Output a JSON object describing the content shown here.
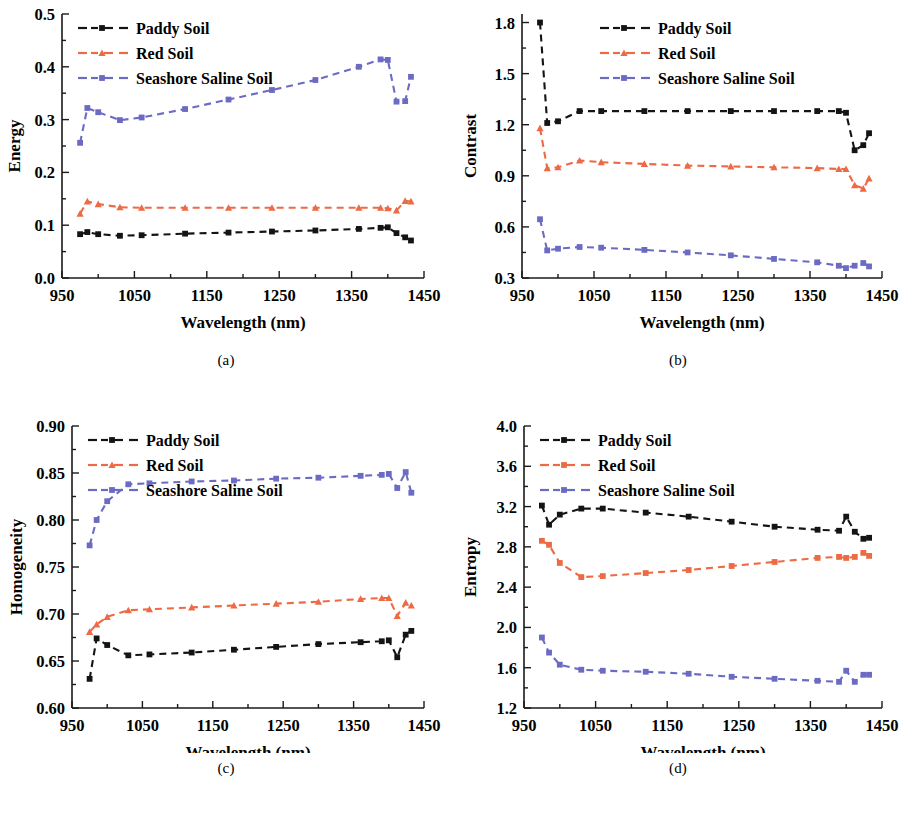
{
  "figure": {
    "panels": [
      {
        "id": "a",
        "caption": "(a)"
      },
      {
        "id": "b",
        "caption": "(b)"
      },
      {
        "id": "c",
        "caption": "(c)"
      },
      {
        "id": "d",
        "caption": "(d)"
      }
    ]
  },
  "legend": {
    "entries": [
      {
        "label": "Paddy Soil",
        "color": "#141414",
        "marker": "square"
      },
      {
        "label": "Red Soil",
        "color": "#ED6A45",
        "marker": "triangle"
      },
      {
        "label": "Seashore Saline Soil",
        "color": "#6B6BC4",
        "marker": "square"
      }
    ]
  },
  "chart_data": [
    {
      "type": "line",
      "panel": "a",
      "title": "",
      "xlabel": "Wavelength (nm)",
      "ylabel": "Energy",
      "xlim": [
        950,
        1450
      ],
      "ylim": [
        0.0,
        0.5
      ],
      "xticks": [
        950,
        1050,
        1150,
        1250,
        1350,
        1450
      ],
      "xticklabels": [
        "950",
        "1050",
        "1150",
        "1250",
        "1350",
        "1450"
      ],
      "yticks": [
        0.0,
        0.1,
        0.2,
        0.3,
        0.4,
        0.5
      ],
      "yticklabels": [
        "0.0",
        "0.1",
        "0.2",
        "0.3",
        "0.4",
        "0.5"
      ],
      "grid": false,
      "legend_position": "top-left",
      "x": [
        975,
        985,
        1000,
        1030,
        1060,
        1120,
        1180,
        1240,
        1300,
        1360,
        1390,
        1400,
        1412,
        1424,
        1432
      ],
      "series": [
        {
          "name": "Paddy Soil",
          "color": "#141414",
          "marker": "square",
          "values": [
            0.083,
            0.087,
            0.083,
            0.08,
            0.081,
            0.084,
            0.086,
            0.088,
            0.09,
            0.093,
            0.095,
            0.096,
            0.085,
            0.077,
            0.071
          ]
        },
        {
          "name": "Red Soil",
          "color": "#ED6A45",
          "marker": "triangle",
          "values": [
            0.122,
            0.145,
            0.14,
            0.134,
            0.133,
            0.133,
            0.133,
            0.133,
            0.133,
            0.133,
            0.133,
            0.132,
            0.128,
            0.146,
            0.145
          ]
        },
        {
          "name": "Seashore Saline Soil",
          "color": "#6B6BC4",
          "marker": "square",
          "values": [
            0.256,
            0.322,
            0.314,
            0.299,
            0.304,
            0.32,
            0.338,
            0.356,
            0.375,
            0.4,
            0.414,
            0.413,
            0.334,
            0.335,
            0.381
          ]
        }
      ]
    },
    {
      "type": "line",
      "panel": "b",
      "title": "",
      "xlabel": "Wavelength (nm)",
      "ylabel": "Contrast",
      "xlim": [
        950,
        1450
      ],
      "ylim": [
        0.3,
        1.85
      ],
      "xticks": [
        950,
        1050,
        1150,
        1250,
        1350,
        1450
      ],
      "xticklabels": [
        "950",
        "1050",
        "1150",
        "1250",
        "1350",
        "1450"
      ],
      "yticks": [
        0.3,
        0.6,
        0.9,
        1.2,
        1.5,
        1.8
      ],
      "yticklabels": [
        "0.3",
        "0.6",
        "0.9",
        "1.2",
        "1.5",
        "1.8"
      ],
      "grid": false,
      "legend_position": "top-center",
      "x": [
        975,
        985,
        1000,
        1030,
        1060,
        1120,
        1180,
        1240,
        1300,
        1360,
        1390,
        1400,
        1412,
        1424,
        1432
      ],
      "series": [
        {
          "name": "Paddy Soil",
          "color": "#141414",
          "marker": "square",
          "values": [
            1.8,
            1.21,
            1.22,
            1.28,
            1.28,
            1.28,
            1.28,
            1.28,
            1.28,
            1.28,
            1.28,
            1.27,
            1.05,
            1.08,
            1.15
          ]
        },
        {
          "name": "Red Soil",
          "color": "#ED6A45",
          "marker": "triangle",
          "values": [
            1.18,
            0.945,
            0.95,
            0.99,
            0.98,
            0.97,
            0.96,
            0.955,
            0.95,
            0.945,
            0.94,
            0.94,
            0.845,
            0.825,
            0.885
          ]
        },
        {
          "name": "Seashore Saline Soil",
          "color": "#6B6BC4",
          "marker": "square",
          "values": [
            0.645,
            0.462,
            0.472,
            0.482,
            0.478,
            0.465,
            0.45,
            0.433,
            0.412,
            0.392,
            0.372,
            0.358,
            0.372,
            0.388,
            0.368
          ]
        }
      ]
    },
    {
      "type": "line",
      "panel": "c",
      "title": "",
      "xlabel": "Wavelength (nm)",
      "ylabel": "Homogeneity",
      "xlim": [
        950,
        1450
      ],
      "ylim": [
        0.6,
        0.9
      ],
      "xticks": [
        950,
        1050,
        1150,
        1250,
        1350,
        1450
      ],
      "xticklabels": [
        "950",
        "1050",
        "1150",
        "1250",
        "1350",
        "1450"
      ],
      "yticks": [
        0.6,
        0.65,
        0.7,
        0.75,
        0.8,
        0.85,
        0.9
      ],
      "yticklabels": [
        "0.60",
        "0.65",
        "0.70",
        "0.75",
        "0.80",
        "0.85",
        "0.90"
      ],
      "grid": false,
      "legend_position": "top-left",
      "x": [
        975,
        985,
        1000,
        1030,
        1060,
        1120,
        1180,
        1240,
        1300,
        1360,
        1390,
        1400,
        1412,
        1424,
        1432
      ],
      "series": [
        {
          "name": "Paddy Soil",
          "color": "#141414",
          "marker": "square",
          "values": [
            0.631,
            0.674,
            0.667,
            0.656,
            0.657,
            0.659,
            0.662,
            0.665,
            0.668,
            0.67,
            0.671,
            0.672,
            0.654,
            0.678,
            0.682
          ]
        },
        {
          "name": "Red Soil",
          "color": "#ED6A45",
          "marker": "triangle",
          "values": [
            0.681,
            0.689,
            0.697,
            0.704,
            0.705,
            0.707,
            0.709,
            0.711,
            0.713,
            0.716,
            0.717,
            0.717,
            0.698,
            0.712,
            0.709
          ]
        },
        {
          "name": "Seashore Saline Soil",
          "color": "#6B6BC4",
          "marker": "square",
          "values": [
            0.773,
            0.8,
            0.82,
            0.838,
            0.839,
            0.841,
            0.842,
            0.844,
            0.845,
            0.847,
            0.848,
            0.849,
            0.834,
            0.851,
            0.829
          ]
        }
      ]
    },
    {
      "type": "line",
      "panel": "d",
      "title": "",
      "xlabel": "Wavelength (nm)",
      "ylabel": "Entropy",
      "xlim": [
        950,
        1450
      ],
      "ylim": [
        1.2,
        4.0
      ],
      "xticks": [
        950,
        1050,
        1150,
        1250,
        1350,
        1450
      ],
      "xticklabels": [
        "950",
        "1050",
        "1150",
        "1250",
        "1350",
        "1450"
      ],
      "yticks": [
        1.2,
        1.6,
        2.0,
        2.4,
        2.8,
        3.2,
        3.6,
        4.0
      ],
      "yticklabels": [
        "1.2",
        "1.6",
        "2.0",
        "2.4",
        "2.8",
        "3.2",
        "3.6",
        "4.0"
      ],
      "grid": false,
      "legend_position": "top-left",
      "x": [
        975,
        985,
        1000,
        1030,
        1060,
        1120,
        1180,
        1240,
        1300,
        1360,
        1390,
        1400,
        1412,
        1424,
        1432
      ],
      "series": [
        {
          "name": "Paddy Soil",
          "color": "#141414",
          "marker": "square",
          "values": [
            3.21,
            3.02,
            3.12,
            3.18,
            3.18,
            3.14,
            3.1,
            3.05,
            3.0,
            2.97,
            2.96,
            3.1,
            2.95,
            2.88,
            2.89
          ]
        },
        {
          "name": "Red Soil",
          "color": "#ED6A45",
          "marker": "square",
          "values": [
            2.86,
            2.82,
            2.64,
            2.5,
            2.51,
            2.54,
            2.57,
            2.61,
            2.65,
            2.69,
            2.7,
            2.69,
            2.7,
            2.74,
            2.71
          ]
        },
        {
          "name": "Seashore Saline Soil",
          "color": "#6B6BC4",
          "marker": "square",
          "values": [
            1.9,
            1.75,
            1.63,
            1.58,
            1.57,
            1.56,
            1.54,
            1.51,
            1.49,
            1.47,
            1.46,
            1.57,
            1.46,
            1.53,
            1.53
          ]
        }
      ]
    }
  ]
}
